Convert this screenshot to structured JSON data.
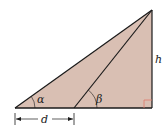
{
  "diagram": {
    "type": "geometry-triangle",
    "fill_color": "#d9bfb3",
    "line_color": "#1a1a1a",
    "right_angle_marker_color": "#e07a6a",
    "labels": {
      "alpha": "α",
      "beta": "β",
      "height": "h",
      "distance": "d"
    },
    "points": {
      "left_vertex": [
        15,
        108
      ],
      "mid_base": [
        74,
        108
      ],
      "top_vertex": [
        152,
        10
      ],
      "right_corner": [
        152,
        108
      ]
    }
  }
}
